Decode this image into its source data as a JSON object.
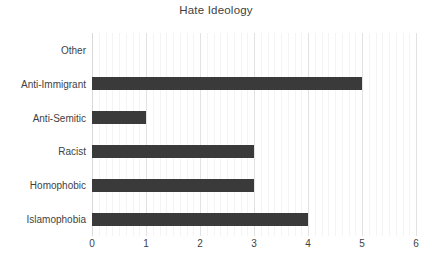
{
  "chart_data": {
    "type": "bar",
    "orientation": "horizontal",
    "title": "Hate Ideology",
    "xlabel": "",
    "ylabel": "",
    "categories": [
      "Other",
      "Anti-Immigrant",
      "Anti-Semitic",
      "Racist",
      "Homophobic",
      "Islamophobia"
    ],
    "values": [
      0,
      5,
      1,
      3,
      3,
      4
    ],
    "xlim": [
      0,
      6
    ],
    "xticks": [
      "0",
      "1",
      "2",
      "3",
      "4",
      "5",
      "6"
    ],
    "xtick_values": [
      0,
      1,
      2,
      3,
      4,
      5,
      6
    ],
    "grid": "vertical-major-and-minor",
    "minor_grid_step": 0.125,
    "legend": "none",
    "bar_color": "#3a3a3a",
    "major_gridline_color": "#e2e2e2",
    "minor_gridline_color": "#f4f4f4",
    "axis_line_color": "#d9d9d9",
    "background_color": "#ffffff",
    "text_color": "#3f3f3f"
  }
}
